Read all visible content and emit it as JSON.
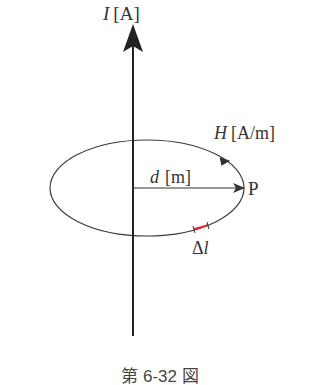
{
  "figure": {
    "caption": "第 6-32 図",
    "colors": {
      "line": "#2b2b2b",
      "text": "#333333",
      "highlight": "#e0303a",
      "background": "#ffffff"
    }
  },
  "labels": {
    "current": {
      "symbol": "I",
      "unit": "[A]"
    },
    "field": {
      "symbol": "H",
      "unit": "[A/m]"
    },
    "distance": {
      "symbol": "d",
      "unit": "[m]"
    },
    "point": "P",
    "segment": {
      "symbol": "Δ",
      "var": "l"
    }
  }
}
